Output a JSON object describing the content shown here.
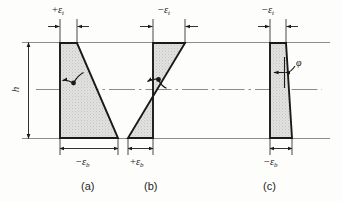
{
  "figure": {
    "height_label": "h",
    "angle_label": "φ",
    "colors": {
      "outline": "#1a1a1a",
      "fill": "#dcdcdc",
      "reference_line": "#8c8c8c",
      "centerline": "#8c8c8c",
      "text": "#1a1a1a"
    }
  },
  "panels": [
    {
      "id": "a",
      "caption": "(a)",
      "top_strain": {
        "sign": "+",
        "symbol": "ε",
        "subscript": "t"
      },
      "bottom_strain": {
        "sign": "−",
        "symbol": "ε",
        "subscript": "b"
      },
      "shape": "trapezoid-right-expanding",
      "has_centroid_marker": true,
      "has_angle_label": false
    },
    {
      "id": "b",
      "caption": "(b)",
      "top_strain": {
        "sign": "−",
        "symbol": "ε",
        "subscript": "t"
      },
      "bottom_strain": {
        "sign": "+",
        "symbol": "ε",
        "subscript": "b"
      },
      "shape": "bowtie-crossing",
      "has_centroid_marker": true,
      "has_angle_label": false
    },
    {
      "id": "c",
      "caption": "(c)",
      "top_strain": {
        "sign": "−",
        "symbol": "ε",
        "subscript": "t"
      },
      "bottom_strain": {
        "sign": "−",
        "symbol": "ε",
        "subscript": "b"
      },
      "shape": "trapezoid-narrow-top",
      "has_centroid_marker": false,
      "has_angle_label": true
    }
  ]
}
